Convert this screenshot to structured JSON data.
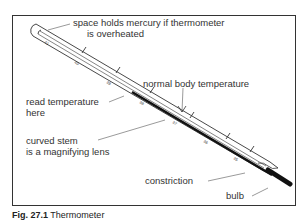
{
  "figure": {
    "caption_label": "Fig. 27.1",
    "caption_text": "Thermometer"
  },
  "labels": {
    "space_line1": "space holds mercury if thermometer",
    "space_line2": "is overheated",
    "normal_body": "normal body temperature",
    "read_line1": "read temperature",
    "read_line2": "here",
    "stem_line1": "curved stem",
    "stem_line2": "is a magnifying lens",
    "constriction": "constriction",
    "bulb": "bulb"
  },
  "scale_marks": [
    "35",
    "36",
    "37",
    "38",
    "39",
    "40",
    "41"
  ],
  "colors": {
    "ink": "#333333",
    "mercury": "#111111",
    "background": "#ffffff"
  }
}
